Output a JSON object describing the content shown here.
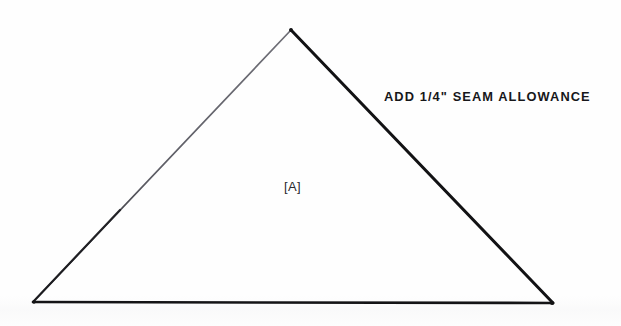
{
  "document": {
    "kind": "sewing-pattern-piece-diagram",
    "background_color": "#fefefe",
    "ink_color": "#17171a",
    "width": 621,
    "height": 326
  },
  "annotations": {
    "seam_allowance_note": "ADD 1/4\" SEAM ALLOWANCE",
    "piece_label": "[A]"
  },
  "shape": {
    "name": "triangle",
    "apex": {
      "x": 291,
      "y": 30
    },
    "bottom_left": {
      "x": 33,
      "y": 302
    },
    "bottom_right": {
      "x": 553,
      "y": 303
    },
    "edges": [
      {
        "name": "left-edge",
        "stroke": "#5a5a60",
        "width": 1.6
      },
      {
        "name": "right-edge",
        "stroke": "#121214",
        "width": 3.0
      },
      {
        "name": "bottom-edge",
        "stroke": "#141416",
        "width": 2.6
      }
    ]
  }
}
